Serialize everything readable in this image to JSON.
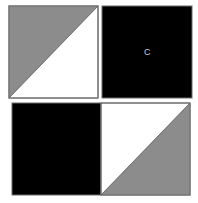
{
  "figure": {
    "colors": {
      "gray": "#8c8c8c",
      "black": "#000000",
      "white": "#ffffff",
      "border": "#6a6a6a",
      "label": "#c8c8c8"
    },
    "top_row": {
      "left_tile": {
        "type": "diagonal-split",
        "upper_left": "gray",
        "lower_right": "white"
      },
      "right_tile": {
        "type": "solid",
        "fill": "black",
        "label": "C"
      }
    },
    "bottom_row": {
      "left_tile": {
        "type": "solid",
        "fill": "black"
      },
      "right_tile": {
        "type": "diagonal-split",
        "upper_left": "white",
        "lower_right": "gray"
      }
    }
  }
}
